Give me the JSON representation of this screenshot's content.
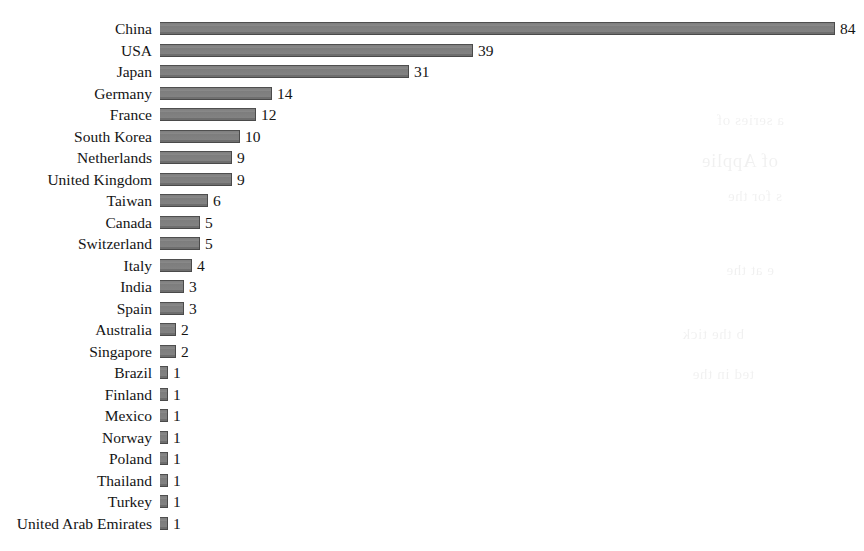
{
  "chart_data": {
    "type": "bar",
    "orientation": "horizontal",
    "title": "",
    "subtitle": "",
    "xlabel": "",
    "ylabel": "",
    "grid": false,
    "legend": null,
    "axis_visible": false,
    "value_labels_shown": true,
    "xlim": [
      0,
      84
    ],
    "categories": [
      "China",
      "USA",
      "Japan",
      "Germany",
      "France",
      "South Korea",
      "Netherlands",
      "United Kingdom",
      "Taiwan",
      "Canada",
      "Switzerland",
      "Italy",
      "India",
      "Spain",
      "Australia",
      "Singapore",
      "Brazil",
      "Finland",
      "Mexico",
      "Norway",
      "Poland",
      "Thailand",
      "Turkey",
      "United Arab Emirates"
    ],
    "values": [
      84,
      39,
      31,
      14,
      12,
      10,
      9,
      9,
      6,
      5,
      5,
      4,
      3,
      3,
      2,
      2,
      1,
      1,
      1,
      1,
      1,
      1,
      1,
      1
    ],
    "bars": [
      {
        "category": "China",
        "value": 84,
        "value_label": "84"
      },
      {
        "category": "USA",
        "value": 39,
        "value_label": "39"
      },
      {
        "category": "Japan",
        "value": 31,
        "value_label": "31"
      },
      {
        "category": "Germany",
        "value": 14,
        "value_label": "14"
      },
      {
        "category": "France",
        "value": 12,
        "value_label": "12"
      },
      {
        "category": "South Korea",
        "value": 10,
        "value_label": "10"
      },
      {
        "category": "Netherlands",
        "value": 9,
        "value_label": "9"
      },
      {
        "category": "United Kingdom",
        "value": 9,
        "value_label": "9"
      },
      {
        "category": "Taiwan",
        "value": 6,
        "value_label": "6"
      },
      {
        "category": "Canada",
        "value": 5,
        "value_label": "5"
      },
      {
        "category": "Switzerland",
        "value": 5,
        "value_label": "5"
      },
      {
        "category": "Italy",
        "value": 4,
        "value_label": "4"
      },
      {
        "category": "India",
        "value": 3,
        "value_label": "3"
      },
      {
        "category": "Spain",
        "value": 3,
        "value_label": "3"
      },
      {
        "category": "Australia",
        "value": 2,
        "value_label": "2"
      },
      {
        "category": "Singapore",
        "value": 2,
        "value_label": "2"
      },
      {
        "category": "Brazil",
        "value": 1,
        "value_label": "1"
      },
      {
        "category": "Finland",
        "value": 1,
        "value_label": "1"
      },
      {
        "category": "Mexico",
        "value": 1,
        "value_label": "1"
      },
      {
        "category": "Norway",
        "value": 1,
        "value_label": "1"
      },
      {
        "category": "Poland",
        "value": 1,
        "value_label": "1"
      },
      {
        "category": "Thailand",
        "value": 1,
        "value_label": "1"
      },
      {
        "category": "Turkey",
        "value": 1,
        "value_label": "1"
      },
      {
        "category": "United Arab Emirates",
        "value": 1,
        "value_label": "1"
      }
    ],
    "colors": {
      "bar_fill": "#828282",
      "bar_edge": "#4a4a4a",
      "text": "#141414",
      "background": "#ffffff"
    }
  },
  "layout": {
    "label_column_width_px": 160,
    "bar_origin_x_px": 168,
    "px_per_unit": 8.03,
    "row_pitch_px": 21.5,
    "bar_height_px": 13,
    "first_row_top_px": 22
  },
  "artifacts": {
    "bleed_through_note": "faint mirrored text from reverse side of scanned page",
    "bleed_lines": [
      "a series of",
      "of Applie",
      "s for the",
      "e at the",
      "b the tick",
      "ted in the"
    ]
  }
}
